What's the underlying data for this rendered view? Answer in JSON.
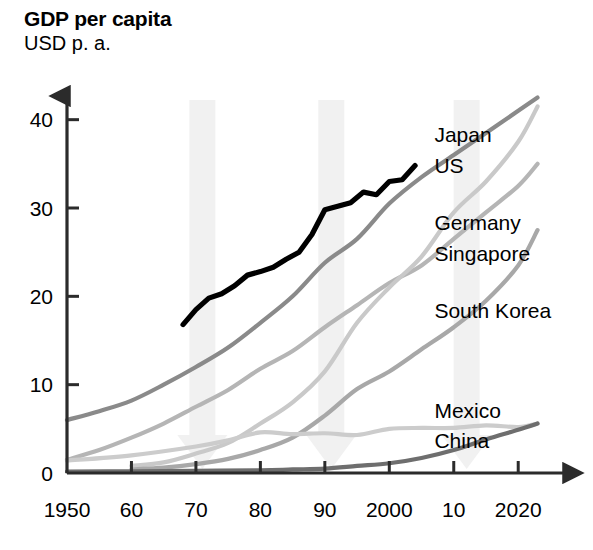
{
  "header": {
    "title": "GDP per capita",
    "subtitle": "USD p. a."
  },
  "chart_data": {
    "type": "line",
    "title": "GDP per capita",
    "subtitle": "USD p. a.",
    "xlabel": "",
    "ylabel": "USD p. a.",
    "xlim": [
      1950,
      2024
    ],
    "ylim": [
      0,
      42
    ],
    "grid": false,
    "legend_position": "inline-right",
    "x_ticks": [
      "1950",
      "60",
      "70",
      "80",
      "90",
      "2000",
      "10",
      "2020"
    ],
    "x_tick_values": [
      1950,
      1960,
      1970,
      1980,
      1990,
      2000,
      2010,
      2020
    ],
    "y_ticks": [
      "0",
      "10",
      "20",
      "30",
      "40"
    ],
    "y_tick_values": [
      0,
      10,
      20,
      30,
      40
    ],
    "annotations": [
      {
        "name": "growth-arrow-1970s",
        "x": 1971,
        "direction": "down"
      },
      {
        "name": "growth-arrow-1990s",
        "x": 1991,
        "direction": "down"
      },
      {
        "name": "growth-arrow-2010s",
        "x": 2012,
        "direction": "down"
      }
    ],
    "series": [
      {
        "name": "Japan",
        "color": "#000000",
        "label_x": 2007,
        "label_y": 37.5,
        "x": [
          1968,
          1970,
          1972,
          1974,
          1976,
          1978,
          1980,
          1982,
          1984,
          1986,
          1988,
          1990,
          1992,
          1994,
          1996,
          1998,
          2000,
          2002,
          2004
        ],
        "values": [
          16.8,
          18.5,
          19.8,
          20.3,
          21.2,
          22.4,
          22.8,
          23.3,
          24.2,
          25.0,
          27.0,
          29.8,
          30.2,
          30.6,
          31.8,
          31.5,
          33.0,
          33.2,
          34.8
        ]
      },
      {
        "name": "US",
        "color": "#8a8a8a",
        "label_x": 2007,
        "label_y": 34.0,
        "x": [
          1950,
          1955,
          1960,
          1965,
          1970,
          1975,
          1980,
          1985,
          1990,
          1995,
          2000,
          2005,
          2010,
          2015,
          2020,
          2023
        ],
        "values": [
          6.0,
          7.0,
          8.2,
          10.0,
          12.0,
          14.2,
          17.0,
          20.0,
          23.8,
          26.5,
          30.5,
          33.5,
          36.0,
          38.5,
          41.0,
          42.5
        ]
      },
      {
        "name": "Germany",
        "color": "#b5b5b5",
        "label_x": 2007,
        "label_y": 27.5,
        "x": [
          1950,
          1955,
          1960,
          1965,
          1970,
          1975,
          1980,
          1985,
          1990,
          1995,
          2000,
          2005,
          2010,
          2015,
          2020,
          2023
        ],
        "values": [
          1.5,
          2.6,
          4.0,
          5.6,
          7.5,
          9.4,
          11.8,
          13.8,
          16.5,
          19.0,
          21.5,
          23.5,
          26.5,
          29.5,
          32.5,
          35.0
        ]
      },
      {
        "name": "Singapore",
        "color": "#c9c9c9",
        "label_x": 2007,
        "label_y": 24.0,
        "x": [
          1960,
          1965,
          1970,
          1975,
          1980,
          1985,
          1990,
          1995,
          2000,
          2005,
          2010,
          2015,
          2020,
          2023
        ],
        "values": [
          0.8,
          1.2,
          2.2,
          3.4,
          5.6,
          8.0,
          11.5,
          17.0,
          21.0,
          24.5,
          29.5,
          33.0,
          37.5,
          41.5
        ]
      },
      {
        "name": "South Korea",
        "color": "#a8a8a8",
        "label_x": 2007,
        "label_y": 17.5,
        "x": [
          1960,
          1965,
          1970,
          1975,
          1980,
          1985,
          1990,
          1995,
          2000,
          2005,
          2010,
          2015,
          2020,
          2023
        ],
        "values": [
          0.4,
          0.6,
          1.0,
          1.6,
          2.6,
          4.0,
          6.5,
          9.5,
          11.5,
          14.0,
          16.5,
          19.5,
          23.5,
          27.5
        ]
      },
      {
        "name": "Mexico",
        "color": "#cccccc",
        "label_x": 2007,
        "label_y": 6.2,
        "x": [
          1950,
          1960,
          1970,
          1975,
          1980,
          1985,
          1990,
          1995,
          2000,
          2005,
          2010,
          2015,
          2020,
          2023
        ],
        "values": [
          1.4,
          2.0,
          3.0,
          3.7,
          4.6,
          4.4,
          4.5,
          4.3,
          5.0,
          5.1,
          5.1,
          5.4,
          5.2,
          5.6
        ]
      },
      {
        "name": "China",
        "color": "#6e6e6e",
        "label_x": 2007,
        "label_y": 2.8,
        "x": [
          1950,
          1960,
          1970,
          1980,
          1985,
          1990,
          1995,
          2000,
          2005,
          2010,
          2015,
          2020,
          2023
        ],
        "values": [
          0.15,
          0.2,
          0.25,
          0.3,
          0.4,
          0.5,
          0.8,
          1.1,
          1.7,
          2.6,
          3.8,
          4.9,
          5.6
        ]
      }
    ]
  }
}
